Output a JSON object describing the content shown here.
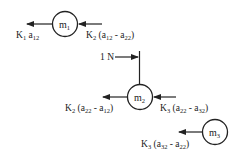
{
  "diagram": {
    "type": "free-body-diagram",
    "colors": {
      "ink": "#222222",
      "background": "#ffffff"
    },
    "masses": [
      {
        "id": "m1",
        "base": "m",
        "sub": "1"
      },
      {
        "id": "m2",
        "base": "m",
        "sub": "2"
      },
      {
        "id": "m3",
        "base": "m",
        "sub": "3"
      }
    ],
    "forces": {
      "m1_left": {
        "k": "K",
        "k_sub": "1",
        "rest": " a",
        "rest_sub": "12",
        "tail": ""
      },
      "m1_right": {
        "k": "K",
        "k_sub": "2",
        "p1": " (a",
        "s1": "12",
        "mid": " - a",
        "s2": "22",
        "end": ")"
      },
      "applied": {
        "label": "1 N"
      },
      "m2_left": {
        "k": "K",
        "k_sub": "2",
        "p1": " (a",
        "s1": "22",
        "mid": " - a",
        "s2": "12",
        "end": ")"
      },
      "m2_right": {
        "k": "K",
        "k_sub": "3",
        "p1": " (a",
        "s1": "22",
        "mid": " - a",
        "s2": "32",
        "end": ")"
      },
      "m3_left": {
        "k": "K",
        "k_sub": "3",
        "p1": " (a",
        "s1": "32",
        "mid": " - a",
        "s2": "22",
        "end": ")"
      }
    }
  }
}
